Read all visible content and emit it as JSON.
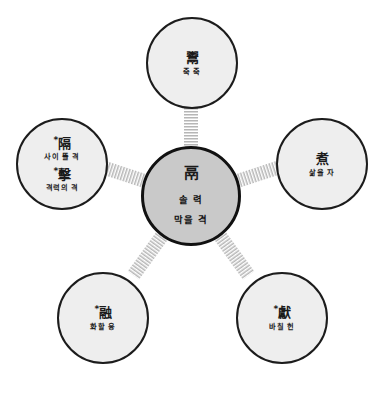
{
  "diagram": {
    "type": "radial-hub-and-spoke",
    "background_color": "#ffffff",
    "center_fill": "#c9c9c9",
    "node_fill": "#eeeeee",
    "stroke_color": "#1c1c1c",
    "connector_style": "hatched-band",
    "center": {
      "id": "center-node",
      "character": "鬲",
      "gloss_1": "솔 력",
      "gloss_2": "막을 격"
    },
    "nodes": [
      {
        "id": "node-top",
        "position": "top",
        "marker": "",
        "character": "鬻",
        "gloss": "죽 죽"
      },
      {
        "id": "node-right",
        "position": "right",
        "marker": "",
        "character": "煮",
        "gloss": "삶을 자"
      },
      {
        "id": "node-bottom-right",
        "position": "bottom-right",
        "marker": "*",
        "character": "獻",
        "gloss": "바칠 헌"
      },
      {
        "id": "node-bottom-left",
        "position": "bottom-left",
        "marker": "*",
        "character": "融",
        "gloss": "화할 융"
      }
    ],
    "left_node": {
      "id": "node-left",
      "position": "left",
      "entries": [
        {
          "marker": "*",
          "character": "隔",
          "gloss": "사이 뜰 격"
        },
        {
          "marker": "*",
          "character": "擊",
          "gloss": "격력의 격"
        }
      ]
    }
  }
}
